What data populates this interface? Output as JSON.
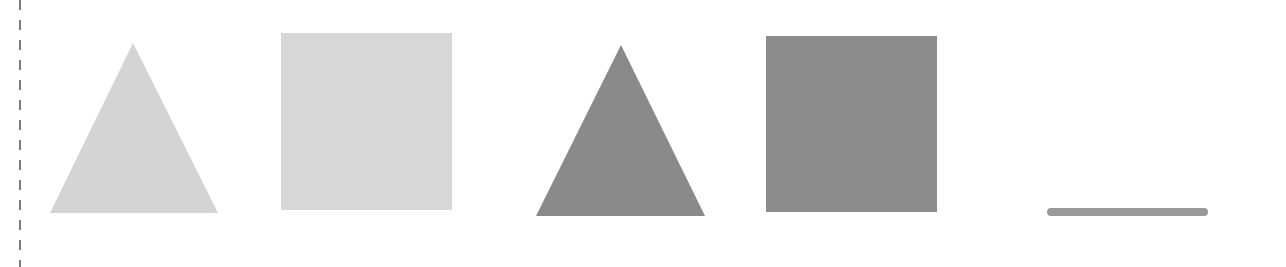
{
  "figure": {
    "background": "#ffffff",
    "divider": {
      "x": 20,
      "y_start": 0,
      "y_end": 267,
      "dash": 10,
      "gap": 10,
      "color": "#555555",
      "width": 1.5
    },
    "shapes": [
      {
        "id": "light-triangle",
        "type": "triangle",
        "points": [
          [
            133,
            43
          ],
          [
            218,
            213
          ],
          [
            50,
            213
          ]
        ],
        "fill": "#d4d4d4"
      },
      {
        "id": "light-square",
        "type": "rect",
        "x": 281,
        "y": 33,
        "width": 171,
        "height": 177,
        "fill": "#d7d7d7"
      },
      {
        "id": "dark-triangle",
        "type": "triangle",
        "points": [
          [
            621,
            45
          ],
          [
            705,
            216
          ],
          [
            536,
            216
          ]
        ],
        "fill": "#8a8a8a"
      },
      {
        "id": "dark-square",
        "type": "rect",
        "x": 766,
        "y": 36,
        "width": 171,
        "height": 176,
        "fill": "#8c8c8c"
      },
      {
        "id": "horizontal-line",
        "type": "line",
        "x1": 1051,
        "y1": 212,
        "x2": 1204,
        "y2": 212,
        "stroke": "#9a9a9a",
        "stroke_width": 8
      }
    ]
  }
}
